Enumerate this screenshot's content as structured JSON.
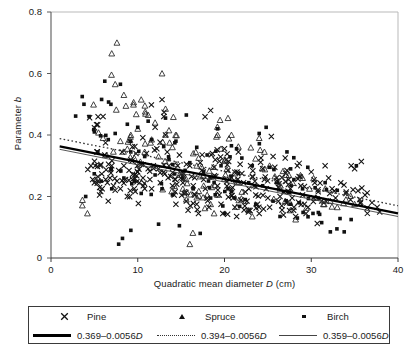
{
  "figure": {
    "background": "#ffffff",
    "ink": "#1a1a1a"
  },
  "axes": {
    "y_title_text": "Parameter ",
    "y_title_italic": "b",
    "x_title_pre": "Quadratic mean diameter ",
    "x_title_italic": "D",
    "x_title_post": " (cm)",
    "y_ticks": [
      "0",
      "0.2",
      "0.4",
      "0.6",
      "0.8"
    ],
    "x_ticks": [
      "0",
      "10",
      "20",
      "30",
      "40"
    ]
  },
  "legend": {
    "markers": [
      {
        "key": "x-marker-icon",
        "label": "Pine"
      },
      {
        "key": "triangle-marker-icon",
        "label": "Spruce"
      },
      {
        "key": "square-marker-icon",
        "label": "Birch"
      }
    ],
    "lines": [
      {
        "key": "thick-solid-line-icon",
        "pre": "0.369–0.0056",
        "italic": "D"
      },
      {
        "key": "dotted-line-icon",
        "pre": "0.394–0.0056",
        "italic": "D"
      },
      {
        "key": "thin-solid-line-icon",
        "pre": "0.359–0.0056",
        "italic": "D"
      }
    ]
  },
  "chart_data": {
    "type": "scatter",
    "title": "",
    "subtitle": "",
    "xlabel": "Quadratic mean diameter D (cm)",
    "ylabel": "Parameter b",
    "xlim": [
      0,
      40
    ],
    "ylim": [
      0,
      0.8
    ],
    "xticks": [
      0,
      10,
      20,
      30,
      40
    ],
    "yticks": [
      0,
      0.2,
      0.4,
      0.6,
      0.8
    ],
    "grid": false,
    "legend_position": "below-axes",
    "colors": {
      "ink": "#111111",
      "line_thick": "#000000",
      "line_dotted": "#333333",
      "line_thin": "#444444"
    },
    "series": [
      {
        "name": "Pine",
        "marker": "x",
        "n": 300,
        "points": [
          [
            4.6,
            0.3
          ],
          [
            4.8,
            0.255
          ],
          [
            5.0,
            0.245
          ],
          [
            5.1,
            0.3
          ],
          [
            5.3,
            0.345
          ],
          [
            5.4,
            0.25
          ],
          [
            5.6,
            0.205
          ],
          [
            5.7,
            0.3
          ],
          [
            5.9,
            0.225
          ],
          [
            6.0,
            0.46
          ],
          [
            6.2,
            0.335
          ],
          [
            6.3,
            0.255
          ],
          [
            6.5,
            0.245
          ],
          [
            6.6,
            0.185
          ],
          [
            6.8,
            0.26
          ],
          [
            7.0,
            0.3
          ],
          [
            7.2,
            0.235
          ],
          [
            7.4,
            0.22
          ],
          [
            7.6,
            0.25
          ],
          [
            7.8,
            0.285
          ],
          [
            8.0,
            0.225
          ],
          [
            8.2,
            0.345
          ],
          [
            8.4,
            0.3
          ],
          [
            8.6,
            0.255
          ],
          [
            8.8,
            0.2
          ],
          [
            9.0,
            0.285
          ],
          [
            9.2,
            0.32
          ],
          [
            9.4,
            0.255
          ],
          [
            9.6,
            0.225
          ],
          [
            9.8,
            0.34
          ],
          [
            10.0,
            0.28
          ],
          [
            10.2,
            0.245
          ],
          [
            10.4,
            0.305
          ],
          [
            10.6,
            0.26
          ],
          [
            10.8,
            0.225
          ],
          [
            11.0,
            0.34
          ],
          [
            11.2,
            0.29
          ],
          [
            11.4,
            0.255
          ],
          [
            11.6,
            0.225
          ],
          [
            11.8,
            0.3
          ],
          [
            12.0,
            0.425
          ],
          [
            12.2,
            0.355
          ],
          [
            12.4,
            0.29
          ],
          [
            12.6,
            0.245
          ],
          [
            12.8,
            0.515
          ],
          [
            13.0,
            0.46
          ],
          [
            13.2,
            0.4
          ],
          [
            13.4,
            0.345
          ],
          [
            13.6,
            0.3
          ],
          [
            13.8,
            0.265
          ],
          [
            14.0,
            0.235
          ],
          [
            14.2,
            0.205
          ],
          [
            14.4,
            0.175
          ],
          [
            14.6,
            0.3
          ],
          [
            14.8,
            0.335
          ],
          [
            15.0,
            0.275
          ],
          [
            15.2,
            0.245
          ],
          [
            15.4,
            0.21
          ],
          [
            15.6,
            0.185
          ],
          [
            15.8,
            0.155
          ],
          [
            16.0,
            0.3
          ],
          [
            16.2,
            0.265
          ],
          [
            16.4,
            0.235
          ],
          [
            16.6,
            0.205
          ],
          [
            16.8,
            0.175
          ],
          [
            17.0,
            0.145
          ],
          [
            17.2,
            0.31
          ],
          [
            17.4,
            0.285
          ],
          [
            17.6,
            0.255
          ],
          [
            17.8,
            0.225
          ],
          [
            18.0,
            0.195
          ],
          [
            18.2,
            0.165
          ],
          [
            18.4,
            0.48
          ],
          [
            18.6,
            0.34
          ],
          [
            18.8,
            0.295
          ],
          [
            19.0,
            0.265
          ],
          [
            19.2,
            0.235
          ],
          [
            19.4,
            0.205
          ],
          [
            19.6,
            0.175
          ],
          [
            19.8,
            0.145
          ],
          [
            20.0,
            0.355
          ],
          [
            20.2,
            0.32
          ],
          [
            20.4,
            0.285
          ],
          [
            20.6,
            0.255
          ],
          [
            20.8,
            0.225
          ],
          [
            21.0,
            0.195
          ],
          [
            21.2,
            0.165
          ],
          [
            21.4,
            0.135
          ],
          [
            21.6,
            0.345
          ],
          [
            21.8,
            0.305
          ],
          [
            22.0,
            0.275
          ],
          [
            22.2,
            0.245
          ],
          [
            22.4,
            0.215
          ],
          [
            22.6,
            0.185
          ],
          [
            22.8,
            0.155
          ],
          [
            23.0,
            0.3
          ],
          [
            23.2,
            0.265
          ],
          [
            23.4,
            0.235
          ],
          [
            23.6,
            0.205
          ],
          [
            23.8,
            0.175
          ],
          [
            24.0,
            0.145
          ],
          [
            24.2,
            0.325
          ],
          [
            24.4,
            0.29
          ],
          [
            24.6,
            0.255
          ],
          [
            24.8,
            0.225
          ],
          [
            25.0,
            0.195
          ],
          [
            25.2,
            0.165
          ],
          [
            25.4,
            0.395
          ],
          [
            25.6,
            0.33
          ],
          [
            25.8,
            0.295
          ],
          [
            26.0,
            0.26
          ],
          [
            26.2,
            0.23
          ],
          [
            26.4,
            0.2
          ],
          [
            26.6,
            0.17
          ],
          [
            26.8,
            0.14
          ],
          [
            27.0,
            0.325
          ],
          [
            27.2,
            0.285
          ],
          [
            27.4,
            0.255
          ],
          [
            27.6,
            0.225
          ],
          [
            27.8,
            0.195
          ],
          [
            28.0,
            0.165
          ],
          [
            28.2,
            0.135
          ],
          [
            28.4,
            0.3
          ],
          [
            28.6,
            0.265
          ],
          [
            28.8,
            0.235
          ],
          [
            29.0,
            0.205
          ],
          [
            29.2,
            0.175
          ],
          [
            29.4,
            0.145
          ],
          [
            30.0,
            0.28
          ],
          [
            30.4,
            0.245
          ],
          [
            30.8,
            0.215
          ],
          [
            31.2,
            0.185
          ],
          [
            31.6,
            0.3
          ],
          [
            32.0,
            0.26
          ],
          [
            32.4,
            0.225
          ],
          [
            32.8,
            0.195
          ],
          [
            33.4,
            0.245
          ],
          [
            34.0,
            0.21
          ],
          [
            34.6,
            0.3
          ],
          [
            35.0,
            0.29
          ],
          [
            35.6,
            0.19
          ],
          [
            36.2,
            0.205
          ],
          [
            37.0,
            0.18
          ],
          [
            37.6,
            0.165
          ]
        ]
      },
      {
        "name": "Spruce",
        "marker": "triangle",
        "n": 150,
        "points": [
          [
            4.2,
            0.145
          ],
          [
            5.2,
            0.255
          ],
          [
            6.0,
            0.39
          ],
          [
            6.4,
            0.335
          ],
          [
            7.0,
            0.665
          ],
          [
            7.4,
            0.565
          ],
          [
            7.6,
            0.7
          ],
          [
            8.0,
            0.38
          ],
          [
            8.4,
            0.53
          ],
          [
            8.8,
            0.355
          ],
          [
            9.2,
            0.4
          ],
          [
            9.6,
            0.325
          ],
          [
            10.0,
            0.42
          ],
          [
            10.4,
            0.515
          ],
          [
            10.8,
            0.345
          ],
          [
            11.2,
            0.465
          ],
          [
            11.6,
            0.385
          ],
          [
            12.0,
            0.44
          ],
          [
            12.4,
            0.33
          ],
          [
            12.8,
            0.6
          ],
          [
            13.2,
            0.485
          ],
          [
            13.6,
            0.415
          ],
          [
            14.0,
            0.36
          ],
          [
            14.4,
            0.305
          ],
          [
            14.8,
            0.27
          ],
          [
            15.2,
            0.225
          ],
          [
            15.6,
            0.19
          ],
          [
            16.0,
            0.045
          ],
          [
            16.4,
            0.34
          ],
          [
            16.8,
            0.3
          ],
          [
            17.2,
            0.265
          ],
          [
            17.6,
            0.235
          ],
          [
            18.0,
            0.205
          ],
          [
            18.4,
            0.175
          ],
          [
            18.8,
            0.145
          ],
          [
            19.2,
            0.4
          ],
          [
            19.6,
            0.355
          ],
          [
            20.0,
            0.315
          ],
          [
            20.4,
            0.455
          ],
          [
            20.8,
            0.4
          ],
          [
            21.2,
            0.275
          ],
          [
            21.6,
            0.245
          ],
          [
            22.0,
            0.215
          ],
          [
            22.4,
            0.185
          ],
          [
            22.8,
            0.155
          ],
          [
            23.2,
            0.135
          ],
          [
            24.0,
            0.39
          ],
          [
            24.6,
            0.345
          ],
          [
            25.2,
            0.3
          ],
          [
            25.8,
            0.265
          ],
          [
            26.4,
            0.225
          ],
          [
            27.0,
            0.185
          ],
          [
            27.6,
            0.155
          ],
          [
            28.2,
            0.125
          ],
          [
            29.0,
            0.26
          ],
          [
            29.8,
            0.225
          ],
          [
            30.6,
            0.195
          ],
          [
            31.4,
            0.175
          ],
          [
            32.2,
            0.185
          ],
          [
            33.0,
            0.165
          ],
          [
            34.0,
            0.19
          ],
          [
            35.0,
            0.175
          ]
        ]
      },
      {
        "name": "Birch",
        "marker": "square",
        "n": 130,
        "points": [
          [
            3.6,
            0.525
          ],
          [
            3.8,
            0.5
          ],
          [
            4.0,
            0.2
          ],
          [
            4.4,
            0.46
          ],
          [
            5.0,
            0.41
          ],
          [
            5.4,
            0.345
          ],
          [
            5.8,
            0.25
          ],
          [
            6.2,
            0.575
          ],
          [
            6.6,
            0.385
          ],
          [
            7.0,
            0.225
          ],
          [
            7.4,
            0.405
          ],
          [
            7.8,
            0.045
          ],
          [
            8.0,
            0.565
          ],
          [
            8.4,
            0.26
          ],
          [
            8.8,
            0.435
          ],
          [
            9.2,
            0.345
          ],
          [
            9.6,
            0.25
          ],
          [
            10.0,
            0.425
          ],
          [
            10.4,
            0.21
          ],
          [
            10.8,
            0.33
          ],
          [
            11.2,
            0.445
          ],
          [
            11.6,
            0.385
          ],
          [
            12.0,
            0.27
          ],
          [
            12.4,
            0.11
          ],
          [
            12.8,
            0.225
          ],
          [
            13.2,
            0.455
          ],
          [
            13.6,
            0.32
          ],
          [
            14.0,
            0.205
          ],
          [
            14.4,
            0.38
          ],
          [
            14.8,
            0.105
          ],
          [
            15.2,
            0.26
          ],
          [
            15.6,
            0.465
          ],
          [
            16.0,
            0.31
          ],
          [
            16.4,
            0.225
          ],
          [
            16.8,
            0.36
          ],
          [
            17.2,
            0.08
          ],
          [
            17.6,
            0.28
          ],
          [
            18.0,
            0.335
          ],
          [
            18.4,
            0.195
          ],
          [
            18.8,
            0.245
          ],
          [
            19.2,
            0.42
          ],
          [
            19.6,
            0.3
          ],
          [
            20.0,
            0.145
          ],
          [
            20.4,
            0.225
          ],
          [
            20.8,
            0.365
          ],
          [
            21.2,
            0.195
          ],
          [
            21.6,
            0.275
          ],
          [
            22.0,
            0.325
          ],
          [
            22.4,
            0.19
          ],
          [
            22.8,
            0.245
          ],
          [
            23.2,
            0.3
          ],
          [
            23.6,
            0.175
          ],
          [
            24.0,
            0.405
          ],
          [
            24.4,
            0.235
          ],
          [
            24.8,
            0.425
          ],
          [
            25.2,
            0.295
          ],
          [
            25.6,
            0.185
          ],
          [
            26.0,
            0.245
          ],
          [
            26.4,
            0.135
          ],
          [
            26.8,
            0.215
          ],
          [
            27.2,
            0.345
          ],
          [
            27.6,
            0.175
          ],
          [
            28.0,
            0.255
          ],
          [
            28.4,
            0.13
          ],
          [
            29.0,
            0.225
          ],
          [
            29.6,
            0.295
          ],
          [
            30.2,
            0.145
          ],
          [
            30.8,
            0.195
          ],
          [
            31.2,
            0.115
          ],
          [
            31.6,
            0.245
          ],
          [
            32.2,
            0.085
          ],
          [
            33.0,
            0.22
          ],
          [
            33.8,
            0.085
          ],
          [
            34.6,
            0.125
          ],
          [
            35.2,
            0.3
          ]
        ]
      }
    ],
    "trend_lines": [
      {
        "name": "Pine",
        "label": "0.369–0.0056D",
        "intercept": 0.369,
        "slope": -0.0056,
        "style": "thick-solid"
      },
      {
        "name": "Spruce",
        "label": "0.394–0.0056D",
        "intercept": 0.394,
        "slope": -0.0056,
        "style": "dotted"
      },
      {
        "name": "Birch",
        "label": "0.359–0.0056D",
        "intercept": 0.359,
        "slope": -0.0056,
        "style": "thin-solid"
      }
    ]
  }
}
